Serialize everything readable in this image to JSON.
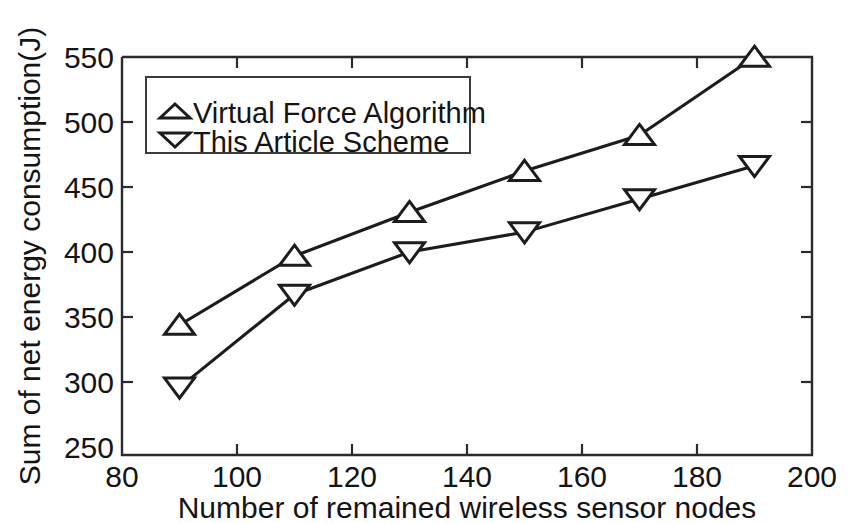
{
  "chart_data": {
    "type": "line",
    "title": "",
    "xlabel": "Number of remained wireless sensor nodes",
    "ylabel": "Sum of net energy consumption(J)",
    "xlim": [
      80,
      200
    ],
    "ylim": [
      250,
      550
    ],
    "xticks": [
      80,
      100,
      120,
      140,
      160,
      180,
      200
    ],
    "xtick_labels": [
      "80",
      "100",
      "120",
      "140",
      "160",
      "180",
      "200"
    ],
    "yticks": [
      250,
      300,
      350,
      400,
      450,
      500,
      550
    ],
    "ytick_labels": [
      "250",
      "300",
      "350",
      "400",
      "450",
      "500",
      "550"
    ],
    "grid": false,
    "legend_position": "upper left",
    "x": [
      90,
      110,
      130,
      150,
      170,
      190
    ],
    "series": [
      {
        "name": "Virtual Force Algorithm",
        "marker": "triangle-up",
        "values": [
          348,
          400,
          433,
          464,
          491,
          550
        ]
      },
      {
        "name": "This Article Scheme",
        "marker": "triangle-down",
        "values": [
          301,
          371,
          403,
          418,
          443,
          468
        ]
      }
    ]
  },
  "legend": {
    "entries": [
      {
        "label": "Virtual Force Algorithm",
        "marker": "triangle-up-icon"
      },
      {
        "label": "This Article Scheme",
        "marker": "triangle-down-icon"
      }
    ]
  },
  "axes": {
    "x_title": "Number of remained wireless sensor nodes",
    "y_title": "Sum of net energy consumption(J)",
    "x_labels": [
      "80",
      "100",
      "120",
      "140",
      "160",
      "180",
      "200"
    ],
    "y_labels": [
      "250",
      "300",
      "350",
      "400",
      "450",
      "500",
      "550"
    ]
  },
  "colors": {
    "line": "#1c1c1c",
    "marker_fill": "#ffffff",
    "axis": "#2b2b2b",
    "background": "#ffffff",
    "text": "#141414"
  }
}
